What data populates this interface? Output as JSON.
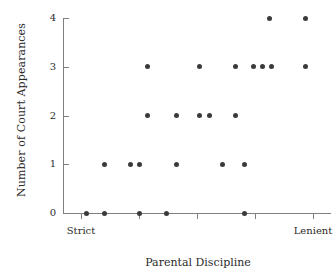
{
  "chart_data": {
    "type": "scatter",
    "title": "",
    "xlabel": "Parental Discipline",
    "ylabel": "Number of Court Appearances",
    "ylim": [
      0,
      4
    ],
    "xlim": [
      0,
      1
    ],
    "grid": false,
    "legend": null,
    "yticks": [
      "0",
      "1",
      "2",
      "3",
      "4"
    ],
    "ytick_values": [
      0,
      1,
      2,
      3,
      4
    ],
    "xtick_count": 5,
    "xtick_labels": [
      "",
      "",
      "",
      "",
      ""
    ],
    "xaxis_endpoint_labels": [
      "Strict",
      "Lenient"
    ],
    "marker": "filled-circle",
    "marker_color": "#3a3a3a",
    "axis_color": "#7f7f7f",
    "points": [
      {
        "x": 0.087,
        "y": 0
      },
      {
        "x": 0.155,
        "y": 0
      },
      {
        "x": 0.287,
        "y": 0
      },
      {
        "x": 0.385,
        "y": 0
      },
      {
        "x": 0.676,
        "y": 0
      },
      {
        "x": 0.155,
        "y": 1
      },
      {
        "x": 0.25,
        "y": 1
      },
      {
        "x": 0.284,
        "y": 1
      },
      {
        "x": 0.424,
        "y": 1
      },
      {
        "x": 0.594,
        "y": 1
      },
      {
        "x": 0.676,
        "y": 1
      },
      {
        "x": 0.317,
        "y": 2
      },
      {
        "x": 0.424,
        "y": 2
      },
      {
        "x": 0.511,
        "y": 2
      },
      {
        "x": 0.545,
        "y": 2
      },
      {
        "x": 0.642,
        "y": 2
      },
      {
        "x": 0.317,
        "y": 3
      },
      {
        "x": 0.511,
        "y": 3
      },
      {
        "x": 0.642,
        "y": 3
      },
      {
        "x": 0.71,
        "y": 3
      },
      {
        "x": 0.744,
        "y": 3
      },
      {
        "x": 0.778,
        "y": 3
      },
      {
        "x": 0.906,
        "y": 3
      },
      {
        "x": 0.77,
        "y": 4
      },
      {
        "x": 0.906,
        "y": 4
      }
    ]
  },
  "axes": {
    "ylabel": "Number of Court Appearances",
    "xlabel": "Parental Discipline",
    "x_left_label": "Strict",
    "x_right_label": "Lenient"
  }
}
